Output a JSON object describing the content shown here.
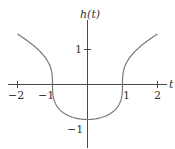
{
  "chart_data": {
    "type": "line",
    "title": "",
    "xlabel": "t",
    "ylabel": "h(t)",
    "xlim": [
      -2.2,
      2.3
    ],
    "ylim": [
      -1.8,
      1.9
    ],
    "grid": false,
    "legend": null,
    "x_ticks": [
      -2,
      -1,
      1,
      2
    ],
    "x_tick_labels": [
      "−2",
      "−1",
      "1",
      "2"
    ],
    "y_ticks": [
      1,
      -1
    ],
    "y_tick_labels": [
      "1",
      "−1"
    ],
    "series": [
      {
        "name": "h(t)",
        "function": "cbrt(t^2 - 1)",
        "x": [
          -2,
          -1.75,
          -1.5,
          -1.25,
          -1.1,
          -1.0,
          -0.9,
          -0.75,
          -0.5,
          -0.25,
          0,
          0.25,
          0.5,
          0.75,
          0.9,
          1.0,
          1.1,
          1.25,
          1.5,
          1.75,
          2
        ],
        "values": [
          1.44,
          1.27,
          1.08,
          0.83,
          0.59,
          0.0,
          -0.57,
          -0.76,
          -0.91,
          -0.98,
          -1.0,
          -0.98,
          -0.91,
          -0.76,
          -0.57,
          0.0,
          0.59,
          0.83,
          1.08,
          1.27,
          1.44
        ]
      }
    ]
  },
  "labels": {
    "y_axis": "h(t)",
    "x_axis": "t",
    "x_neg2": "−2",
    "x_neg1": "−1",
    "x_pos1": "1",
    "x_pos2": "2",
    "y_pos1": "1",
    "y_neg1": "−1"
  }
}
